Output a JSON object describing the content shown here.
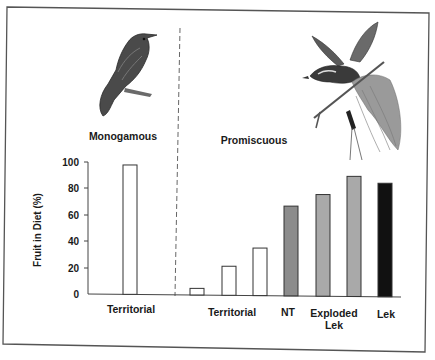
{
  "figure": {
    "group_labels": {
      "left": "Monogamous",
      "right": "Promiscuous"
    },
    "illustrations": {
      "left": "monogamous-bird-illustration",
      "right": "bird-of-paradise-illustration"
    }
  },
  "chart_data": {
    "type": "bar",
    "title": "",
    "xlabel": "",
    "ylabel": "Fruit in Diet (%)",
    "ylim": [
      0,
      100
    ],
    "yticks": [
      0,
      20,
      40,
      60,
      80,
      100
    ],
    "grid": false,
    "legend": null,
    "groups": [
      {
        "name": "Monogamous",
        "category_labels": [
          "Territorial"
        ]
      },
      {
        "name": "Promiscuous",
        "category_labels": [
          "Territorial",
          "NT",
          "Exploded Lek",
          "Lek"
        ]
      }
    ],
    "bars": [
      {
        "group": "Monogamous",
        "category": "Territorial",
        "value": 98,
        "color": "#ffffff"
      },
      {
        "group": "Promiscuous",
        "category": "Territorial",
        "value": 5,
        "color": "#ffffff"
      },
      {
        "group": "Promiscuous",
        "category": "Territorial",
        "value": 22,
        "color": "#ffffff"
      },
      {
        "group": "Promiscuous",
        "category": "Territorial",
        "value": 36,
        "color": "#ffffff"
      },
      {
        "group": "Promiscuous",
        "category": "NT",
        "value": 68,
        "color": "#8c8c8c"
      },
      {
        "group": "Promiscuous",
        "category": "Exploded Lek",
        "value": 77,
        "color": "#a9a9a9"
      },
      {
        "group": "Promiscuous",
        "category": "Exploded Lek",
        "value": 91,
        "color": "#a9a9a9"
      },
      {
        "group": "Promiscuous",
        "category": "Lek",
        "value": 86,
        "color": "#111111"
      }
    ],
    "x_labels": [
      {
        "text": "Territorial",
        "lines": [
          "Territorial"
        ]
      },
      {
        "text": "Territorial",
        "lines": [
          "Territorial"
        ]
      },
      {
        "text": "NT",
        "lines": [
          "NT"
        ]
      },
      {
        "text": "Exploded Lek",
        "lines": [
          "Exploded",
          "Lek"
        ]
      },
      {
        "text": "Lek",
        "lines": [
          "Lek"
        ]
      }
    ]
  }
}
